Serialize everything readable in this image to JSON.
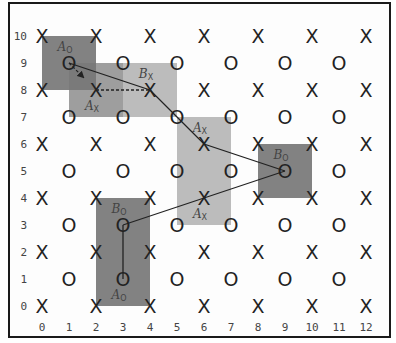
{
  "diagram": {
    "type": "grid-lattice",
    "x_ticks": [
      "0",
      "1",
      "2",
      "3",
      "4",
      "5",
      "6",
      "7",
      "8",
      "9",
      "10",
      "11",
      "12"
    ],
    "y_ticks": [
      "0",
      "1",
      "2",
      "3",
      "4",
      "5",
      "6",
      "7",
      "8",
      "9",
      "10"
    ],
    "grid": {
      "origin_px": [
        42,
        306
      ],
      "step_px": [
        27.0,
        27.0
      ]
    },
    "marker_rule": "even rows: X at even columns; odd rows: O at odd columns",
    "markers": {
      "X": "X",
      "O": "O"
    },
    "colors": {
      "dark_box": "#777777",
      "medium_box": "#999999",
      "light_box": "#b8b8b8",
      "line": "#222222",
      "frame": "#1a1a1a"
    },
    "boxes": [
      {
        "id": "A_O_top",
        "col_range": [
          0,
          2
        ],
        "row_range": [
          8,
          10
        ],
        "shade": "dark",
        "label": "A",
        "sub": "O",
        "label_at": [
          1,
          9.6
        ]
      },
      {
        "id": "A_X_top",
        "col_range": [
          1,
          3
        ],
        "row_range": [
          7,
          9
        ],
        "shade": "medium",
        "label": "A",
        "sub": "X",
        "label_at": [
          2,
          7.4
        ]
      },
      {
        "id": "B_X_top",
        "col_range": [
          3,
          5
        ],
        "row_range": [
          7,
          9
        ],
        "shade": "light",
        "label": "B",
        "sub": "X",
        "label_at": [
          4,
          8.6
        ]
      },
      {
        "id": "A_X_mid",
        "col_range": [
          5,
          7
        ],
        "row_range": [
          3,
          7
        ],
        "shade": "light",
        "label": "A",
        "sub": "X",
        "label_at": [
          6,
          6.6
        ]
      },
      {
        "id": "A_X_mid_low",
        "col_range": [
          5,
          7
        ],
        "row_range": [
          3,
          7
        ],
        "shade": "none",
        "label": "A",
        "sub": "X",
        "label_at": [
          6,
          3.4
        ]
      },
      {
        "id": "B_O_right",
        "col_range": [
          8,
          10
        ],
        "row_range": [
          4,
          6
        ],
        "shade": "dark",
        "label": "B",
        "sub": "O",
        "label_at": [
          9,
          5.6
        ]
      },
      {
        "id": "B_O_bottom",
        "col_range": [
          2,
          4
        ],
        "row_range": [
          2,
          4
        ],
        "shade": "dark",
        "label": "B",
        "sub": "O",
        "label_at": [
          3,
          3.6
        ]
      },
      {
        "id": "A_O_bottom",
        "col_range": [
          2,
          4
        ],
        "row_range": [
          0,
          2
        ],
        "shade": "dark",
        "label": "A",
        "sub": "O",
        "label_at": [
          3,
          0.4
        ]
      }
    ],
    "paths": [
      {
        "style": "solid",
        "points": [
          [
            1,
            9
          ],
          [
            4,
            8
          ],
          [
            5,
            7
          ],
          [
            6,
            6
          ],
          [
            9,
            5
          ]
        ]
      },
      {
        "style": "solid",
        "points": [
          [
            9,
            5
          ],
          [
            6,
            4
          ],
          [
            3,
            3
          ]
        ]
      },
      {
        "style": "solid",
        "points": [
          [
            3,
            3
          ],
          [
            3,
            1
          ]
        ]
      },
      {
        "style": "dashed",
        "points": [
          [
            2,
            8
          ],
          [
            4,
            8
          ]
        ]
      },
      {
        "style": "dashed-arrow",
        "points": [
          [
            1,
            9
          ],
          [
            2,
            8
          ]
        ]
      }
    ]
  }
}
